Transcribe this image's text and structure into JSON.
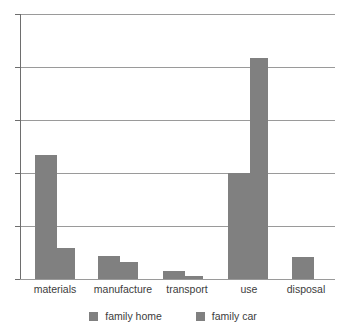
{
  "chart_data": {
    "type": "bar",
    "title": "",
    "xlabel": "",
    "ylabel": "",
    "grid": true,
    "legend_position": "bottom",
    "ylim": [
      0,
      5
    ],
    "y_tick_count": 5,
    "y_tick_labels": [],
    "categories": [
      "materials",
      "manufacture",
      "transport",
      "use",
      "disposal"
    ],
    "series": [
      {
        "name": "family home",
        "color": "#808080",
        "values": [
          2.34,
          0.43,
          0.15,
          2.0,
          0.42
        ]
      },
      {
        "name": "family car",
        "color": "#808080",
        "values": [
          0.58,
          0.32,
          0.06,
          4.17,
          0
        ]
      }
    ]
  },
  "axis": {
    "gridline_color": "#9a9a9a",
    "axis_color": "#6e6e6e"
  },
  "legend": {
    "entries": [
      {
        "label": "family home",
        "swatch": "legend-swatch-family-home"
      },
      {
        "label": "family car",
        "swatch": "legend-swatch-family-car"
      }
    ]
  }
}
